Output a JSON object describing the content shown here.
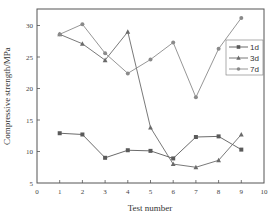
{
  "chart_data": {
    "type": "line",
    "title": "",
    "xlabel": "Test number",
    "ylabel": "Compressive strength/MPa",
    "xlim": [
      0,
      10
    ],
    "ylim": [
      5,
      32.5
    ],
    "xticks": [
      0,
      1,
      2,
      3,
      4,
      5,
      6,
      7,
      8,
      9,
      10
    ],
    "yticks": [
      5,
      10,
      15,
      20,
      25,
      30
    ],
    "grid": false,
    "legend_position": "upper right (inside, mid-height)",
    "x": [
      1,
      2,
      3,
      4,
      5,
      6,
      7,
      8,
      9
    ],
    "series": [
      {
        "name": "1d",
        "marker": "square",
        "color": "#666666",
        "values": [
          12.9,
          12.7,
          9.0,
          10.2,
          10.1,
          8.9,
          12.3,
          12.4,
          10.3
        ]
      },
      {
        "name": "3d",
        "marker": "triangle",
        "color": "#666666",
        "values": [
          28.6,
          27.1,
          24.5,
          29.0,
          13.8,
          8.0,
          7.5,
          8.6,
          12.7
        ]
      },
      {
        "name": "7d",
        "marker": "circle",
        "color": "#888888",
        "values": [
          28.6,
          30.2,
          25.6,
          22.4,
          24.6,
          27.3,
          18.6,
          26.3,
          31.2
        ]
      }
    ]
  },
  "colors": {
    "axis": "#555555",
    "series_1d": "#5a5a5a",
    "series_3d": "#6a6a6a",
    "series_7d": "#8a8a8a"
  }
}
